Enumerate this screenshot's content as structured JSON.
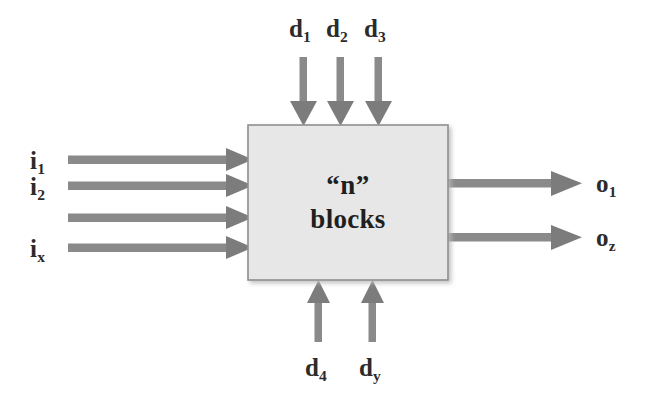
{
  "diagram": {
    "type": "block-diagram",
    "canvas": {
      "width": 653,
      "height": 411,
      "background": "#ffffff"
    },
    "colors": {
      "arrow": "#8a8a8a",
      "arrow_dark": "#7c7c7c",
      "block_fill": "#e7e7e7",
      "block_stroke": "#8f8f8f",
      "text": "#2b2b2b",
      "shadow": "#cfcfcf"
    },
    "block": {
      "line1": "“n”",
      "line2": "blocks",
      "x": 248,
      "y": 125,
      "width": 200,
      "height": 155
    },
    "inputs": {
      "side": "left",
      "count": 4,
      "items": [
        {
          "label_base": "i",
          "label_sub": "1",
          "y": 160,
          "labeled": true
        },
        {
          "label_base": "i",
          "label_sub": "2",
          "y": 186,
          "labeled": true
        },
        {
          "label_base": "",
          "label_sub": "",
          "y": 218,
          "labeled": false
        },
        {
          "label_base": "i",
          "label_sub": "x",
          "y": 248,
          "labeled": true
        }
      ]
    },
    "outputs": {
      "side": "right",
      "count": 2,
      "items": [
        {
          "label_base": "o",
          "label_sub": "1",
          "y": 183
        },
        {
          "label_base": "o",
          "label_sub": "z",
          "y": 237
        }
      ]
    },
    "disturbances_top": {
      "side": "top",
      "count": 3,
      "items": [
        {
          "label_base": "d",
          "label_sub": "1",
          "x": 303
        },
        {
          "label_base": "d",
          "label_sub": "2",
          "x": 340
        },
        {
          "label_base": "d",
          "label_sub": "3",
          "x": 378
        }
      ]
    },
    "disturbances_bottom": {
      "side": "bottom",
      "count": 2,
      "items": [
        {
          "label_base": "d",
          "label_sub": "4",
          "x": 318
        },
        {
          "label_base": "d",
          "label_sub": "y",
          "x": 372
        }
      ]
    }
  }
}
